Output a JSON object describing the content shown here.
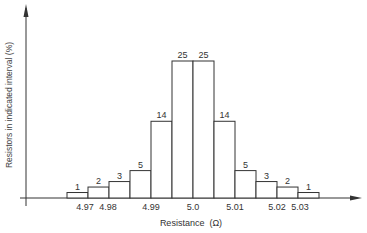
{
  "chart_data": {
    "type": "bar",
    "title": "",
    "xlabel": "Resistance  (Ω)",
    "ylabel": "Resistors in indicated interval (%)",
    "categories": [
      "4.965-4.975",
      "4.975-4.985",
      "4.985-4.99",
      "4.99-4.995",
      "4.995-5.0",
      "5.0-5.005",
      "5.005-5.01",
      "5.01-5.015",
      "5.015-5.02",
      "5.02-5.025",
      "5.025-5.03",
      "5.03-5.035"
    ],
    "values": [
      1,
      2,
      3,
      5,
      14,
      25,
      25,
      14,
      5,
      3,
      2,
      1
    ],
    "x_tick_labels": [
      "4.97",
      "4.98",
      "4.99",
      "5.0",
      "5.01",
      "5.02",
      "5.03"
    ],
    "ylim": [
      0,
      30
    ],
    "grid": false,
    "legend": null
  }
}
